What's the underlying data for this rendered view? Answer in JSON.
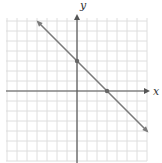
{
  "chart_data": {
    "type": "line",
    "title": "",
    "xlabel": "x",
    "ylabel": "y",
    "xlim": [
      -7,
      7
    ],
    "ylim": [
      -7,
      7
    ],
    "grid": true,
    "grid_step": 1,
    "series": [
      {
        "name": "y = -x + 3",
        "equation": "y = -x + 3",
        "slope": -1,
        "intercept": 3,
        "x": [
          -3.9,
          0,
          3,
          7
        ],
        "y": [
          6.9,
          3,
          0,
          -4
        ],
        "marked_points": [
          {
            "label": "y-intercept",
            "x": 0,
            "y": 3
          },
          {
            "label": "x-intercept",
            "x": 3,
            "y": 0
          }
        ],
        "arrows_both_ends": true
      }
    ]
  },
  "colors": {
    "grid": "#dedede",
    "axis": "#555555",
    "line": "#7a7a7a",
    "point": "#666666"
  },
  "labels": {
    "x_axis": "x",
    "y_axis": "y"
  }
}
